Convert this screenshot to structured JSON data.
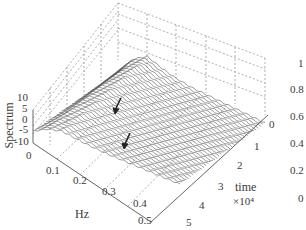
{
  "chart_data": {
    "type": "surface-waterfall-3d",
    "title": "",
    "axes": {
      "x": {
        "label": "Hz",
        "ticks": [
          "0",
          "0.1",
          "0.2",
          "0.3",
          "0.4",
          "0.5"
        ],
        "range": [
          0,
          0.5
        ]
      },
      "y": {
        "label": "time",
        "multiplier": "×10⁴",
        "ticks": [
          "0",
          "1",
          "2",
          "3",
          "4",
          "5"
        ],
        "range": [
          0,
          5
        ]
      },
      "z": {
        "label": "Spectrum",
        "ticks": [
          "10",
          "5",
          "0",
          "-5",
          "-10"
        ],
        "range": [
          -10,
          10
        ]
      }
    },
    "colorbar": {
      "ticks": [
        "1",
        "0.8",
        "0.6",
        "0.4",
        "0.2",
        "0"
      ],
      "range": [
        0,
        1
      ]
    },
    "grid": true,
    "series_description": "Stacked spectrum traces over time; high peaks near low frequency (~0.05–0.15 Hz), decaying toward higher frequency",
    "annotations": [
      {
        "type": "arrow",
        "approx_hz": 0.22,
        "approx_time": 0.8
      },
      {
        "type": "arrow",
        "approx_hz": 0.3,
        "approx_time": 2.2
      }
    ],
    "approx_profile": {
      "hz": [
        0,
        0.05,
        0.1,
        0.15,
        0.2,
        0.25,
        0.3,
        0.35,
        0.4,
        0.45,
        0.5
      ],
      "spectrum": [
        -8,
        4,
        9,
        5,
        2,
        0,
        -1,
        -2,
        -3,
        -4,
        -5
      ]
    }
  },
  "labels": {
    "z_title": "Spectrum",
    "x_title": "Hz",
    "y_title": "time",
    "y_mult": "×10⁴",
    "z_ticks": [
      "10",
      "5",
      "0",
      "-5",
      "-10"
    ],
    "x_ticks": [
      "0",
      "0.1",
      "0.2",
      "0.3",
      "0.4",
      "0.5"
    ],
    "y_ticks": [
      "0",
      "1",
      "2",
      "3",
      "4",
      "5"
    ],
    "cb_ticks": [
      "1",
      "0.8",
      "0.6",
      "0.4",
      "0.2",
      "0"
    ]
  }
}
